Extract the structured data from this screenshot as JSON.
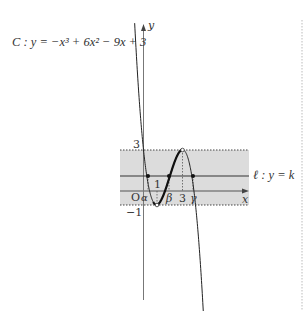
{
  "curve": {
    "name": "C",
    "equation_label": "C : y = −x³ + 6x² − 9x + 3",
    "coefficients": {
      "a": -1,
      "b": 6,
      "c": -9,
      "d": 3
    },
    "local_max": {
      "x": 3,
      "y": 3
    },
    "local_min": {
      "x": 1,
      "y": -1
    }
  },
  "line": {
    "name": "ℓ",
    "label": "ℓ : y = k",
    "k": 1.1
  },
  "axes": {
    "x_label": "x",
    "y_label": "y",
    "origin_label": "O",
    "tick_labels": {
      "y_3": "3",
      "y_neg1": "−1",
      "x_1": "1",
      "x_3": "3"
    }
  },
  "intersections": {
    "alpha": "α",
    "beta": "β",
    "gamma": "γ"
  },
  "band": {
    "y_min": -1,
    "y_max": 3,
    "color": "#dcdcdc"
  },
  "colors": {
    "curve": "#222222",
    "axis": "#555555",
    "dotted": "#444444",
    "band": "#dcdcdc",
    "page_divider": "#bbbbbb"
  }
}
